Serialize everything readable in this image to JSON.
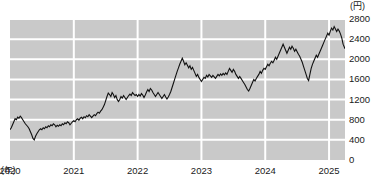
{
  "chart_data": {
    "type": "line",
    "title": "",
    "subtitle": "",
    "xlabel": "(年)",
    "ylabel": "(円)",
    "unit_y": "(円)",
    "unit_x": "(年)",
    "grid": true,
    "legend": null,
    "ylim": [
      0,
      2800
    ],
    "xlim": [
      2020.0,
      2025.25
    ],
    "ytick_labels": [
      "2800",
      "2400",
      "2000",
      "1600",
      "1200",
      "800",
      "400",
      "0"
    ],
    "ytick_values": [
      2800,
      2400,
      2000,
      1600,
      1200,
      800,
      400,
      0
    ],
    "xtick_labels": [
      "2020",
      "2021",
      "2022",
      "2023",
      "2024",
      "2025"
    ],
    "xtick_values": [
      2020,
      2021,
      2022,
      2023,
      2024,
      2025
    ],
    "series": [
      {
        "name": "price",
        "color": "#111111",
        "x": [
          2020.0,
          2020.02,
          2020.04,
          2020.06,
          2020.08,
          2020.1,
          2020.12,
          2020.14,
          2020.16,
          2020.18,
          2020.2,
          2020.22,
          2020.24,
          2020.26,
          2020.28,
          2020.3,
          2020.32,
          2020.34,
          2020.36,
          2020.38,
          2020.4,
          2020.42,
          2020.44,
          2020.46,
          2020.48,
          2020.5,
          2020.52,
          2020.54,
          2020.56,
          2020.58,
          2020.6,
          2020.62,
          2020.64,
          2020.66,
          2020.68,
          2020.7,
          2020.72,
          2020.74,
          2020.76,
          2020.78,
          2020.8,
          2020.82,
          2020.84,
          2020.86,
          2020.88,
          2020.9,
          2020.92,
          2020.94,
          2020.96,
          2020.98,
          2021.0,
          2021.02,
          2021.04,
          2021.06,
          2021.08,
          2021.1,
          2021.12,
          2021.14,
          2021.16,
          2021.18,
          2021.2,
          2021.22,
          2021.24,
          2021.26,
          2021.28,
          2021.3,
          2021.32,
          2021.34,
          2021.36,
          2021.38,
          2021.4,
          2021.42,
          2021.44,
          2021.46,
          2021.48,
          2021.5,
          2021.52,
          2021.54,
          2021.56,
          2021.58,
          2021.6,
          2021.62,
          2021.64,
          2021.66,
          2021.68,
          2021.7,
          2021.72,
          2021.74,
          2021.76,
          2021.78,
          2021.8,
          2021.82,
          2021.84,
          2021.86,
          2021.88,
          2021.9,
          2021.92,
          2021.94,
          2021.96,
          2021.98,
          2022.0,
          2022.02,
          2022.04,
          2022.06,
          2022.08,
          2022.1,
          2022.12,
          2022.14,
          2022.16,
          2022.18,
          2022.2,
          2022.22,
          2022.24,
          2022.26,
          2022.28,
          2022.3,
          2022.32,
          2022.34,
          2022.36,
          2022.38,
          2022.4,
          2022.42,
          2022.44,
          2022.46,
          2022.48,
          2022.5,
          2022.52,
          2022.54,
          2022.56,
          2022.58,
          2022.6,
          2022.62,
          2022.64,
          2022.66,
          2022.68,
          2022.7,
          2022.72,
          2022.74,
          2022.76,
          2022.78,
          2022.8,
          2022.82,
          2022.84,
          2022.86,
          2022.88,
          2022.9,
          2022.92,
          2022.94,
          2022.96,
          2022.98,
          2023.0,
          2023.02,
          2023.04,
          2023.06,
          2023.08,
          2023.1,
          2023.12,
          2023.14,
          2023.16,
          2023.18,
          2023.2,
          2023.22,
          2023.24,
          2023.26,
          2023.28,
          2023.3,
          2023.32,
          2023.34,
          2023.36,
          2023.38,
          2023.4,
          2023.42,
          2023.44,
          2023.46,
          2023.48,
          2023.5,
          2023.52,
          2023.54,
          2023.56,
          2023.58,
          2023.6,
          2023.62,
          2023.64,
          2023.66,
          2023.68,
          2023.7,
          2023.72,
          2023.74,
          2023.76,
          2023.78,
          2023.8,
          2023.82,
          2023.84,
          2023.86,
          2023.88,
          2023.9,
          2023.92,
          2023.94,
          2023.96,
          2023.98,
          2024.0,
          2024.02,
          2024.04,
          2024.06,
          2024.08,
          2024.1,
          2024.12,
          2024.14,
          2024.16,
          2024.18,
          2024.2,
          2024.22,
          2024.24,
          2024.26,
          2024.28,
          2024.3,
          2024.32,
          2024.34,
          2024.36,
          2024.38,
          2024.4,
          2024.42,
          2024.44,
          2024.46,
          2024.48,
          2024.5,
          2024.52,
          2024.54,
          2024.56,
          2024.58,
          2024.6,
          2024.62,
          2024.64,
          2024.66,
          2024.68,
          2024.7,
          2024.72,
          2024.74,
          2024.76,
          2024.78,
          2024.8,
          2024.82,
          2024.84,
          2024.86,
          2024.88,
          2024.9,
          2024.92,
          2024.94,
          2024.96,
          2024.98,
          2025.0,
          2025.02,
          2025.04,
          2025.06,
          2025.08,
          2025.1,
          2025.12,
          2025.14,
          2025.16,
          2025.18,
          2025.2,
          2025.22,
          2025.25
        ],
        "y": [
          600,
          640,
          700,
          760,
          820,
          800,
          850,
          830,
          870,
          840,
          800,
          760,
          720,
          690,
          660,
          620,
          560,
          500,
          430,
          400,
          470,
          520,
          560,
          600,
          620,
          600,
          640,
          620,
          660,
          640,
          680,
          660,
          700,
          680,
          720,
          700,
          660,
          690,
          670,
          700,
          680,
          720,
          700,
          740,
          720,
          760,
          740,
          700,
          730,
          760,
          780,
          760,
          800,
          820,
          790,
          830,
          850,
          820,
          860,
          840,
          880,
          860,
          900,
          870,
          840,
          870,
          900,
          880,
          920,
          950,
          930,
          970,
          1000,
          1050,
          1100,
          1180,
          1260,
          1330,
          1300,
          1260,
          1340,
          1300,
          1240,
          1280,
          1200,
          1160,
          1200,
          1260,
          1230,
          1280,
          1240,
          1200,
          1240,
          1280,
          1310,
          1280,
          1340,
          1310,
          1280,
          1300,
          1260,
          1300,
          1270,
          1320,
          1290,
          1240,
          1290,
          1350,
          1400,
          1360,
          1420,
          1390,
          1340,
          1300,
          1260,
          1300,
          1340,
          1300,
          1260,
          1220,
          1260,
          1300,
          1250,
          1210,
          1250,
          1300,
          1360,
          1440,
          1520,
          1600,
          1680,
          1760,
          1830,
          1900,
          1960,
          2020,
          1960,
          1890,
          1930,
          1880,
          1830,
          1870,
          1800,
          1840,
          1780,
          1720,
          1660,
          1700,
          1640,
          1600,
          1560,
          1600,
          1640,
          1620,
          1680,
          1650,
          1700,
          1670,
          1640,
          1680,
          1650,
          1620,
          1660,
          1700,
          1670,
          1710,
          1680,
          1720,
          1690,
          1730,
          1700,
          1760,
          1820,
          1780,
          1740,
          1800,
          1760,
          1700,
          1660,
          1620,
          1660,
          1620,
          1580,
          1540,
          1500,
          1450,
          1400,
          1370,
          1420,
          1480,
          1540,
          1600,
          1570,
          1620,
          1660,
          1700,
          1760,
          1720,
          1780,
          1820,
          1800,
          1850,
          1900,
          1870,
          1920,
          1960,
          1930,
          1980,
          2040,
          2000,
          2060,
          2120,
          2180,
          2240,
          2300,
          2240,
          2180,
          2120,
          2180,
          2240,
          2200,
          2260,
          2220,
          2160,
          2200,
          2150,
          2100,
          2060,
          2000,
          1940,
          1860,
          1780,
          1700,
          1620,
          1580,
          1700,
          1820,
          1900,
          1960,
          2020,
          2080,
          2040,
          2100,
          2160,
          2220,
          2280,
          2340,
          2400,
          2460,
          2520,
          2480,
          2560,
          2620,
          2580,
          2650,
          2600,
          2550,
          2600,
          2560,
          2500,
          2420,
          2300,
          2210
        ]
      }
    ]
  },
  "axis": {
    "y_unit_label": "(円)",
    "x_unit_label": "(年)"
  }
}
